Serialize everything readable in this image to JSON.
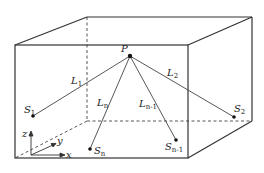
{
  "diagram": {
    "type": "3d-box-source-localization",
    "point_label": "P",
    "sources": [
      {
        "name": "S",
        "sub": "1"
      },
      {
        "name": "S",
        "sub": "2"
      },
      {
        "name": "S",
        "sub": "n"
      },
      {
        "name": "S",
        "sub": "n-1"
      }
    ],
    "lines": [
      {
        "name": "L",
        "sub": "1"
      },
      {
        "name": "L",
        "sub": "2"
      },
      {
        "name": "L",
        "sub": "n"
      },
      {
        "name": "L",
        "sub": "n-1"
      }
    ],
    "axes": {
      "x": "x",
      "y": "y",
      "z": "z"
    },
    "colors": {
      "line": "#333333",
      "background": "#ffffff"
    }
  }
}
